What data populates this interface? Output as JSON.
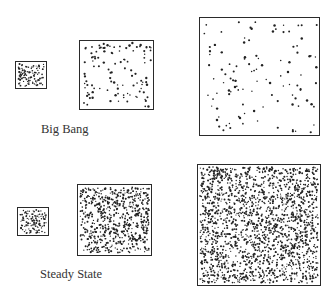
{
  "labels": {
    "big_bang": "Big Bang",
    "steady_state": "Steady State"
  },
  "colors": {
    "dot": "#222222",
    "border": "#2a2a2a",
    "text": "#333333"
  },
  "rows": [
    {
      "model": "Big Bang",
      "boxes": [
        {
          "x": 15,
          "y": 61,
          "w": 32,
          "h": 28,
          "dots": 110,
          "r": 0.8,
          "seed": 11
        },
        {
          "x": 79,
          "y": 40,
          "w": 75,
          "h": 70,
          "dots": 110,
          "r": 1.0,
          "seed": 23
        },
        {
          "x": 199,
          "y": 17,
          "w": 121,
          "h": 119,
          "dots": 110,
          "r": 1.0,
          "seed": 37
        }
      ]
    },
    {
      "model": "Steady State",
      "boxes": [
        {
          "x": 17,
          "y": 207,
          "w": 32,
          "h": 29,
          "dots": 120,
          "r": 0.8,
          "seed": 41
        },
        {
          "x": 77,
          "y": 184,
          "w": 75,
          "h": 72,
          "dots": 650,
          "r": 0.85,
          "seed": 53
        },
        {
          "x": 197,
          "y": 164,
          "w": 124,
          "h": 122,
          "dots": 1800,
          "r": 0.85,
          "seed": 67
        }
      ]
    }
  ]
}
